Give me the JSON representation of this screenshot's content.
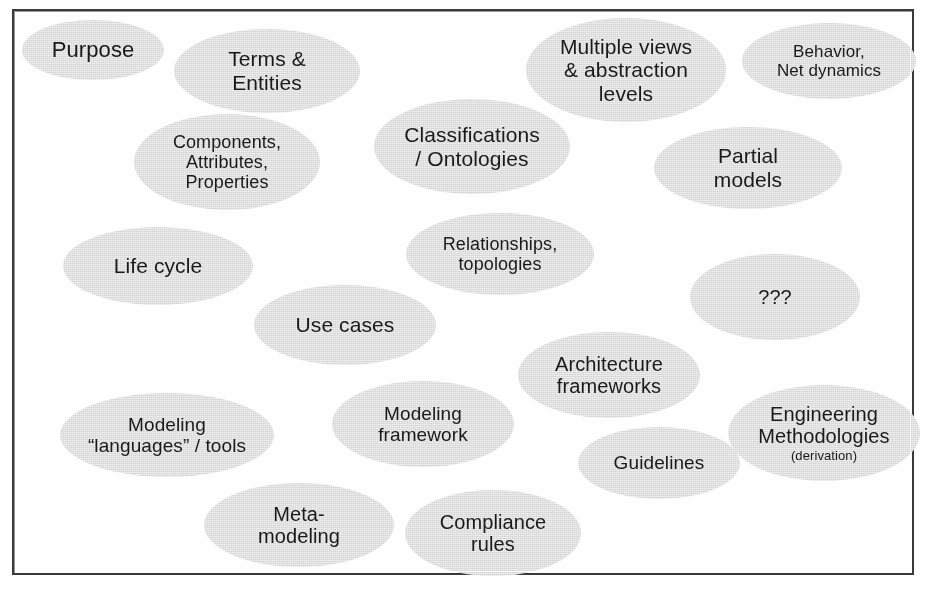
{
  "figure": {
    "kind": "concept-bubble-diagram",
    "frame_border_color": "#3a3a3a",
    "background_color": "#ffffff",
    "bubble_fill_color": "#d4d4d4",
    "text_color": "#1a1a1a"
  },
  "bubbles": [
    {
      "id": "purpose",
      "label": "Purpose",
      "left": 20,
      "top": 18,
      "width": 142,
      "height": 60,
      "font_size": 22
    },
    {
      "id": "terms-entities",
      "label": "Terms &\nEntities",
      "left": 172,
      "top": 27,
      "width": 186,
      "height": 84,
      "font_size": 21
    },
    {
      "id": "multiple-views",
      "label": "Multiple views\n& abstraction\nlevels",
      "left": 524,
      "top": 16,
      "width": 200,
      "height": 104,
      "font_size": 21
    },
    {
      "id": "behavior-net-dynamics",
      "label": "Behavior,\nNet dynamics",
      "left": 740,
      "top": 21,
      "width": 174,
      "height": 76,
      "font_size": 17
    },
    {
      "id": "components-attributes-properties",
      "label": "Components,\nAttributes,\nProperties",
      "left": 132,
      "top": 112,
      "width": 186,
      "height": 96,
      "font_size": 18
    },
    {
      "id": "classifications-ontologies",
      "label": "Classifications\n/ Ontologies",
      "left": 372,
      "top": 97,
      "width": 196,
      "height": 95,
      "font_size": 21
    },
    {
      "id": "partial-models",
      "label": "Partial\nmodels",
      "left": 652,
      "top": 125,
      "width": 188,
      "height": 82,
      "font_size": 21
    },
    {
      "id": "life-cycle",
      "label": "Life cycle",
      "left": 61,
      "top": 225,
      "width": 190,
      "height": 78,
      "font_size": 21
    },
    {
      "id": "relationships-topologies",
      "label": "Relationships,\ntopologies",
      "left": 404,
      "top": 211,
      "width": 188,
      "height": 82,
      "font_size": 18
    },
    {
      "id": "unknown",
      "label": "???",
      "left": 688,
      "top": 252,
      "width": 170,
      "height": 86,
      "font_size": 20
    },
    {
      "id": "use-cases",
      "label": "Use cases",
      "left": 252,
      "top": 283,
      "width": 182,
      "height": 80,
      "font_size": 21
    },
    {
      "id": "architecture-frameworks",
      "label": "Architecture\nframeworks",
      "left": 516,
      "top": 330,
      "width": 182,
      "height": 86,
      "font_size": 20
    },
    {
      "id": "modeling-framework",
      "label": "Modeling\nframework",
      "left": 330,
      "top": 379,
      "width": 182,
      "height": 86,
      "font_size": 19
    },
    {
      "id": "modeling-languages-tools",
      "label": "Modeling\n“languages” / tools",
      "left": 58,
      "top": 391,
      "width": 214,
      "height": 84,
      "font_size": 19
    },
    {
      "id": "engineering-methodologies",
      "label": "Engineering\nMethodologies",
      "sub_label": "(derivation)",
      "left": 726,
      "top": 383,
      "width": 192,
      "height": 96,
      "font_size": 20
    },
    {
      "id": "guidelines",
      "label": "Guidelines",
      "left": 576,
      "top": 425,
      "width": 162,
      "height": 72,
      "font_size": 19
    },
    {
      "id": "meta-modeling",
      "label": "Meta-\nmodeling",
      "left": 202,
      "top": 481,
      "width": 190,
      "height": 84,
      "font_size": 20
    },
    {
      "id": "compliance-rules",
      "label": "Compliance\nrules",
      "left": 403,
      "top": 488,
      "width": 176,
      "height": 86,
      "font_size": 20
    }
  ]
}
